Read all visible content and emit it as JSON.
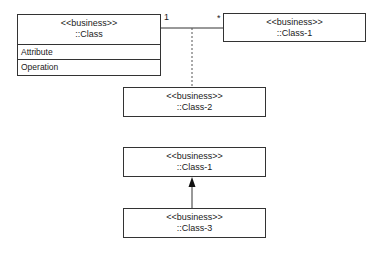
{
  "diagram": {
    "type": "UML class diagram",
    "classes": [
      {
        "id": "class",
        "stereotype": "<<business>>",
        "name": "::Class",
        "attributes_label": "Attribute",
        "operations_label": "Operation"
      },
      {
        "id": "class1_top",
        "stereotype": "<<business>>",
        "name": "::Class-1"
      },
      {
        "id": "class2",
        "stereotype": "<<business>>",
        "name": "::Class-2"
      },
      {
        "id": "class1_bottom",
        "stereotype": "<<business>>",
        "name": "::Class-1"
      },
      {
        "id": "class3",
        "stereotype": "<<business>>",
        "name": "::Class-3"
      }
    ],
    "association": {
      "source_multiplicity": "1",
      "target_multiplicity": "*"
    },
    "colors": {
      "line": "#333333",
      "background": "#ffffff"
    }
  }
}
